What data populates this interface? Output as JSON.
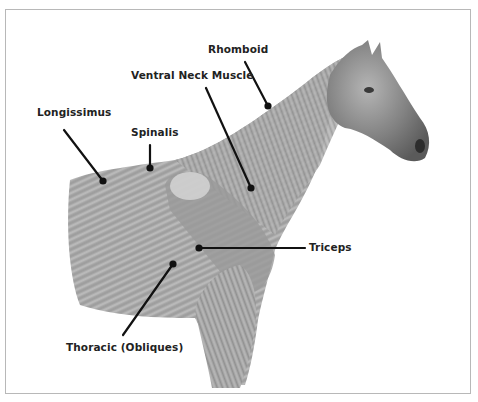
{
  "diagram": {
    "labels": [
      {
        "id": "rhomboid",
        "text": "Rhomboid",
        "x": 208,
        "y": 43,
        "line": [
          245,
          62,
          268,
          106
        ]
      },
      {
        "id": "ventral-neck-muscle",
        "text": "Ventral Neck Muscle",
        "x": 131,
        "y": 69,
        "line": [
          206,
          88,
          251,
          188
        ]
      },
      {
        "id": "longissimus",
        "text": "Longissimus",
        "x": 37,
        "y": 106,
        "line": [
          64,
          130,
          103,
          181
        ]
      },
      {
        "id": "spinalis",
        "text": "Spinalis",
        "x": 131,
        "y": 126,
        "line": [
          150,
          145,
          150,
          168
        ]
      },
      {
        "id": "triceps",
        "text": "Triceps",
        "x": 309,
        "y": 241,
        "line": [
          199,
          248,
          305,
          248
        ]
      },
      {
        "id": "thoracic-obliques",
        "text": "Thoracic (Obliques)",
        "x": 66,
        "y": 341,
        "line": [
          123,
          335,
          173,
          264
        ]
      }
    ],
    "colors": {
      "frame": "#b8b8b8",
      "muscle_fill": "#a9a9a9",
      "muscle_dark": "#7d7d7d",
      "head_fill": "#8a8a8a",
      "leader_line": "#111111",
      "label_text": "#222222"
    }
  }
}
